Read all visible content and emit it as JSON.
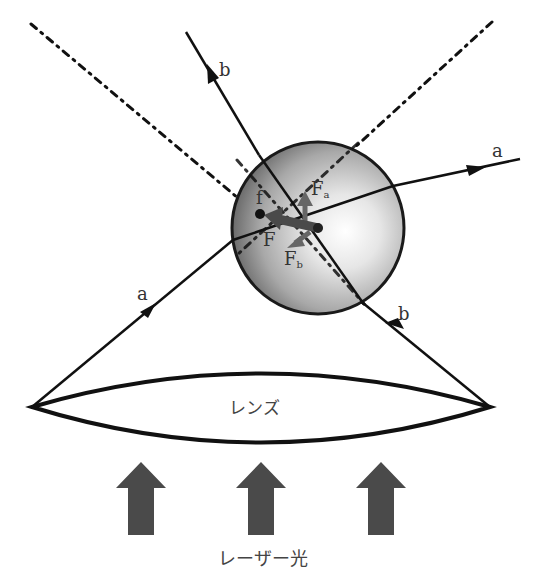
{
  "labels": {
    "ray_b_top": "b",
    "ray_a_right": "a",
    "focus": "f",
    "force_a": "F",
    "force_a_sub": "a",
    "force_total": "F",
    "force_b": "F",
    "force_b_sub": "b",
    "ray_a_left": "a",
    "ray_b_bottom": "b",
    "lens": "レンズ",
    "laser": "レーザー光"
  },
  "colors": {
    "line": "#111111",
    "arrow_fill": "#4a4a4a",
    "force_arrow": "#555555",
    "sphere_edge": "#1a1a1a",
    "sphere_light": "#ffffff",
    "sphere_dark": "#5a5a5a"
  },
  "geometry": {
    "sphere": {
      "cx": 318,
      "cy": 228,
      "r": 86
    },
    "lens": {
      "left": [
        32,
        407
      ],
      "right": [
        490,
        407
      ]
    },
    "laser_arrows_x": [
      141,
      261,
      381
    ]
  }
}
